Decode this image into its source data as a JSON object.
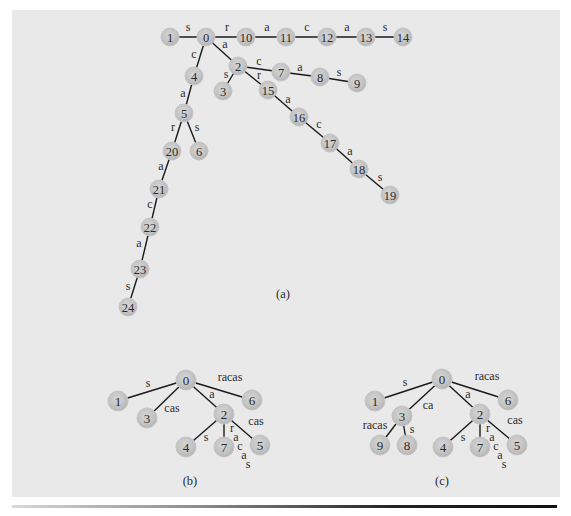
{
  "figure": {
    "panel_color": "#e9e9e9",
    "node_fill": "#c8c8c8",
    "edge_color": "#1a1a1a"
  },
  "diagrams": [
    {
      "id": "a",
      "caption": "(a)",
      "caption_pos": [
        283,
        298
      ],
      "node_radius": 9,
      "nodes": [
        {
          "id": "0",
          "x": 206,
          "y": 37
        },
        {
          "id": "1",
          "x": 170,
          "y": 37
        },
        {
          "id": "10",
          "x": 246,
          "y": 37
        },
        {
          "id": "11",
          "x": 286,
          "y": 37
        },
        {
          "id": "12",
          "x": 327,
          "y": 37
        },
        {
          "id": "13",
          "x": 366,
          "y": 37
        },
        {
          "id": "14",
          "x": 403,
          "y": 37
        },
        {
          "id": "2",
          "x": 238,
          "y": 66
        },
        {
          "id": "3",
          "x": 223,
          "y": 91
        },
        {
          "id": "4",
          "x": 194,
          "y": 76
        },
        {
          "id": "5",
          "x": 184,
          "y": 113
        },
        {
          "id": "6",
          "x": 199,
          "y": 151
        },
        {
          "id": "7",
          "x": 281,
          "y": 72
        },
        {
          "id": "8",
          "x": 320,
          "y": 77
        },
        {
          "id": "9",
          "x": 357,
          "y": 83
        },
        {
          "id": "15",
          "x": 268,
          "y": 90
        },
        {
          "id": "16",
          "x": 299,
          "y": 117
        },
        {
          "id": "17",
          "x": 330,
          "y": 143
        },
        {
          "id": "18",
          "x": 359,
          "y": 169
        },
        {
          "id": "19",
          "x": 390,
          "y": 195
        },
        {
          "id": "20",
          "x": 172,
          "y": 151
        },
        {
          "id": "21",
          "x": 159,
          "y": 189
        },
        {
          "id": "22",
          "x": 150,
          "y": 227
        },
        {
          "id": "23",
          "x": 140,
          "y": 269
        },
        {
          "id": "24",
          "x": 128,
          "y": 307
        }
      ],
      "edges": [
        {
          "from": "0",
          "to": "1",
          "label": "s",
          "lx": 188,
          "ly": 31
        },
        {
          "from": "0",
          "to": "10",
          "label": "r",
          "lx": 227,
          "ly": 31
        },
        {
          "from": "10",
          "to": "11",
          "label": "a",
          "lx": 267,
          "ly": 31
        },
        {
          "from": "11",
          "to": "12",
          "label": "c",
          "lx": 307,
          "ly": 31
        },
        {
          "from": "12",
          "to": "13",
          "label": "a",
          "lx": 347,
          "ly": 31
        },
        {
          "from": "13",
          "to": "14",
          "label": "s",
          "lx": 385,
          "ly": 31
        },
        {
          "from": "0",
          "to": "4",
          "label": "c",
          "lx": 194,
          "ly": 58
        },
        {
          "from": "0",
          "to": "2",
          "label": "a",
          "lx": 225,
          "ly": 48
        },
        {
          "from": "4",
          "to": "5",
          "label": "a",
          "lx": 183,
          "ly": 97
        },
        {
          "from": "2",
          "to": "3",
          "label": "s",
          "lx": 226,
          "ly": 78
        },
        {
          "from": "2",
          "to": "7",
          "label": "c",
          "lx": 259,
          "ly": 65
        },
        {
          "from": "7",
          "to": "8",
          "label": "a",
          "lx": 300,
          "ly": 71
        },
        {
          "from": "8",
          "to": "9",
          "label": "s",
          "lx": 339,
          "ly": 76
        },
        {
          "from": "2",
          "to": "15",
          "label": "r",
          "lx": 259,
          "ly": 79
        },
        {
          "from": "15",
          "to": "16",
          "label": "a",
          "lx": 288,
          "ly": 103
        },
        {
          "from": "16",
          "to": "17",
          "label": "c",
          "lx": 319,
          "ly": 128
        },
        {
          "from": "17",
          "to": "18",
          "label": "a",
          "lx": 350,
          "ly": 155
        },
        {
          "from": "18",
          "to": "19",
          "label": "s",
          "lx": 380,
          "ly": 181
        },
        {
          "from": "5",
          "to": "20",
          "label": "r",
          "lx": 173,
          "ly": 131
        },
        {
          "from": "5",
          "to": "6",
          "label": "s",
          "lx": 197,
          "ly": 131
        },
        {
          "from": "20",
          "to": "21",
          "label": "a",
          "lx": 161,
          "ly": 170
        },
        {
          "from": "21",
          "to": "22",
          "label": "c",
          "lx": 150,
          "ly": 208
        },
        {
          "from": "22",
          "to": "23",
          "label": "a",
          "lx": 139,
          "ly": 247
        },
        {
          "from": "23",
          "to": "24",
          "label": "s",
          "lx": 128,
          "ly": 290
        }
      ]
    },
    {
      "id": "b",
      "caption": "(b)",
      "caption_pos": [
        190,
        485
      ],
      "node_radius": 10,
      "nodes": [
        {
          "id": "0",
          "x": 186,
          "y": 380
        },
        {
          "id": "1",
          "x": 118,
          "y": 401
        },
        {
          "id": "3",
          "x": 147,
          "y": 418
        },
        {
          "id": "6",
          "x": 252,
          "y": 400
        },
        {
          "id": "2",
          "x": 224,
          "y": 414
        },
        {
          "id": "4",
          "x": 186,
          "y": 447
        },
        {
          "id": "7",
          "x": 224,
          "y": 447
        },
        {
          "id": "5",
          "x": 260,
          "y": 445
        }
      ],
      "edges": [
        {
          "from": "0",
          "to": "1",
          "label": "s",
          "lx": 148,
          "ly": 387
        },
        {
          "from": "0",
          "to": "3",
          "label": "cas",
          "lx": 172,
          "ly": 412
        },
        {
          "from": "0",
          "to": "6",
          "label": "racas",
          "lx": 230,
          "ly": 381
        },
        {
          "from": "0",
          "to": "2",
          "label": "a",
          "lx": 212,
          "ly": 398
        },
        {
          "from": "2",
          "to": "4",
          "label": "s",
          "lx": 206,
          "ly": 441
        },
        {
          "from": "2",
          "to": "7",
          "label": "",
          "lx": 0,
          "ly": 0
        },
        {
          "from": "2",
          "to": "5",
          "label": "cas",
          "lx": 256,
          "ly": 425
        }
      ],
      "vertical_labels": [
        {
          "text": "r",
          "x": 232,
          "y": 432
        },
        {
          "text": "a",
          "x": 236,
          "y": 441
        },
        {
          "text": "c",
          "x": 240,
          "y": 450
        },
        {
          "text": "a",
          "x": 244,
          "y": 459
        },
        {
          "text": "s",
          "x": 248,
          "y": 468
        }
      ]
    },
    {
      "id": "c",
      "caption": "(c)",
      "caption_pos": [
        442,
        485
      ],
      "node_radius": 10,
      "nodes": [
        {
          "id": "0",
          "x": 442,
          "y": 379
        },
        {
          "id": "1",
          "x": 375,
          "y": 401
        },
        {
          "id": "3",
          "x": 402,
          "y": 416
        },
        {
          "id": "6",
          "x": 508,
          "y": 400
        },
        {
          "id": "2",
          "x": 480,
          "y": 414
        },
        {
          "id": "9",
          "x": 380,
          "y": 445
        },
        {
          "id": "8",
          "x": 407,
          "y": 445
        },
        {
          "id": "4",
          "x": 443,
          "y": 447
        },
        {
          "id": "7",
          "x": 480,
          "y": 447
        },
        {
          "id": "5",
          "x": 517,
          "y": 445
        }
      ],
      "edges": [
        {
          "from": "0",
          "to": "1",
          "label": "s",
          "lx": 405,
          "ly": 386
        },
        {
          "from": "0",
          "to": "3",
          "label": "ca",
          "lx": 428,
          "ly": 409
        },
        {
          "from": "0",
          "to": "6",
          "label": "racas",
          "lx": 487,
          "ly": 380
        },
        {
          "from": "0",
          "to": "2",
          "label": "a",
          "lx": 468,
          "ly": 398
        },
        {
          "from": "3",
          "to": "9",
          "label": "racas",
          "lx": 375,
          "ly": 429
        },
        {
          "from": "3",
          "to": "8",
          "label": "s",
          "lx": 412,
          "ly": 433
        },
        {
          "from": "2",
          "to": "4",
          "label": "s",
          "lx": 463,
          "ly": 441
        },
        {
          "from": "2",
          "to": "7",
          "label": "",
          "lx": 0,
          "ly": 0
        },
        {
          "from": "2",
          "to": "5",
          "label": "cas",
          "lx": 515,
          "ly": 424
        }
      ],
      "vertical_labels": [
        {
          "text": "r",
          "x": 488,
          "y": 432
        },
        {
          "text": "a",
          "x": 492,
          "y": 441
        },
        {
          "text": "c",
          "x": 496,
          "y": 450
        },
        {
          "text": "a",
          "x": 500,
          "y": 459
        },
        {
          "text": "s",
          "x": 504,
          "y": 468
        }
      ]
    }
  ]
}
